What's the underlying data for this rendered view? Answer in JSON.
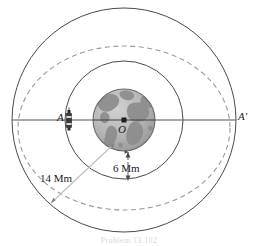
{
  "figure": {
    "caption": "Problem 13.102",
    "labels": {
      "point_a": "A",
      "point_a_prime": "A'",
      "center": "O",
      "earth_radius": "6 Mm",
      "orbit_radius": "14 Mm"
    },
    "colors": {
      "stroke": "#4a4a4a",
      "axis": "#555555",
      "leader": "#b9b9b9",
      "dashed_orbit": "#9a9a9a",
      "earth_ocean": "#b4b4b4",
      "earth_land": "#8e8e8e",
      "earth_outline": "#6a6a6a",
      "background": "#ffffff",
      "satellite": "#2a2a2a"
    },
    "geometry": {
      "center_x": 124,
      "center_y": 120,
      "earth_radius_px": 31,
      "inner_orbit_radius_px": 59,
      "outer_orbit_radius_px": 112,
      "dashed_ellipse_semi_major": 86,
      "dashed_ellipse_semi_minor": 78
    },
    "elements": {
      "earth": "earth-globe",
      "inner_orbit": "inner-circular-orbit",
      "outer_orbit": "outer-circular-orbit",
      "transfer_orbit": "dashed-transfer-ellipse",
      "axis": "apse-line-axis",
      "satellite": "satellite-icon",
      "earth_radius_dimension": "earth-radius-dimension-arrow",
      "orbit_radius_leader": "orbit-radius-leader-line"
    }
  }
}
